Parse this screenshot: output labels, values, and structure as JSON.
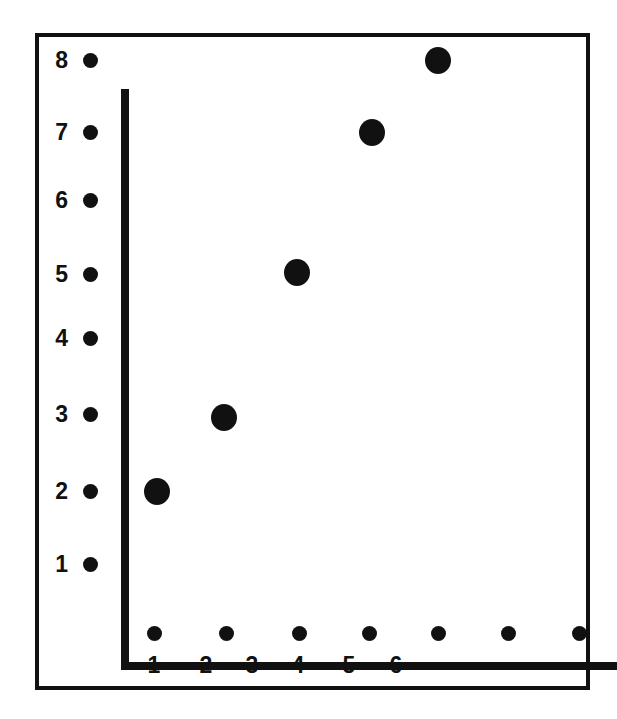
{
  "chart_data": {
    "type": "scatter",
    "title": "",
    "subtitle": "",
    "xlabel": "",
    "ylabel": "",
    "grid": false,
    "legend": null,
    "xlim": [
      0,
      7.6
    ],
    "ylim": [
      0,
      8.6
    ],
    "x_tick_labels": [
      "1",
      "2",
      "3",
      "4",
      "5",
      "6"
    ],
    "y_tick_labels": [
      "1",
      "2",
      "3",
      "4",
      "5",
      "6",
      "7",
      "8"
    ],
    "x": [
      1,
      2.4,
      3.8,
      5.3,
      6.5
    ],
    "y": [
      2,
      3,
      5,
      7,
      8
    ],
    "points": [
      {
        "label": "point-1",
        "x": 1,
        "y": 2
      },
      {
        "label": "point-2",
        "x": 2.4,
        "y": 3
      },
      {
        "label": "point-3",
        "x": 3.8,
        "y": 5
      },
      {
        "label": "point-4",
        "x": 5.3,
        "y": 7
      },
      {
        "label": "point-5",
        "x": 6.5,
        "y": 8
      }
    ],
    "marker_color": "#111111",
    "axis_color": "#111111",
    "background_color": "#ffffff"
  },
  "axes": {
    "y_ticks": [
      {
        "label": "8",
        "px": 56,
        "label_px": 56
      },
      {
        "label": "7",
        "px": 128,
        "label_px": 128
      },
      {
        "label": "6",
        "px": 196,
        "label_px": 196
      },
      {
        "label": "5",
        "px": 270,
        "label_px": 270
      },
      {
        "label": "4",
        "px": 334,
        "label_px": 334
      },
      {
        "label": "3",
        "px": 410,
        "label_px": 410
      },
      {
        "label": "2",
        "px": 487,
        "label_px": 487
      },
      {
        "label": "1",
        "px": 560,
        "label_px": 560
      }
    ],
    "x_ticks": [
      {
        "label": "1",
        "px": 150,
        "label_px": 150
      },
      {
        "label": "2",
        "px": 222,
        "label_px": 202
      },
      {
        "label": "3",
        "px": 295,
        "label_px": 248
      },
      {
        "label": "4",
        "px": 365,
        "label_px": 294
      },
      {
        "label": "5",
        "px": 434,
        "label_px": 345
      },
      {
        "label": "6",
        "px": 504,
        "label_px": 392
      },
      {
        "label": "",
        "px": 575,
        "label_px": null
      }
    ]
  },
  "markers": [
    {
      "name": "data-point-1",
      "left": 153,
      "top": 487
    },
    {
      "name": "data-point-2",
      "left": 220,
      "top": 413
    },
    {
      "name": "data-point-3",
      "left": 293,
      "top": 268
    },
    {
      "name": "data-point-4",
      "left": 368,
      "top": 128
    },
    {
      "name": "data-point-5",
      "left": 434,
      "top": 56
    }
  ]
}
